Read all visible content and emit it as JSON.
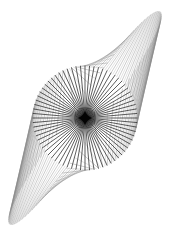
{
  "figure": {
    "width": 169,
    "height": 240,
    "background": "#ffffff",
    "center": [
      85,
      118
    ],
    "circle_radius": 52,
    "radial_count": 72,
    "radial_color": "#2a2a2a",
    "radial_width": 0.9,
    "spindle_tip_top": [
      160,
      12
    ],
    "spindle_tip_bottom": [
      10,
      228
    ],
    "spindle_color": "#8a8a8a",
    "spindle_width": 0.5,
    "spindle_count": 72,
    "core_color": "#000000"
  }
}
